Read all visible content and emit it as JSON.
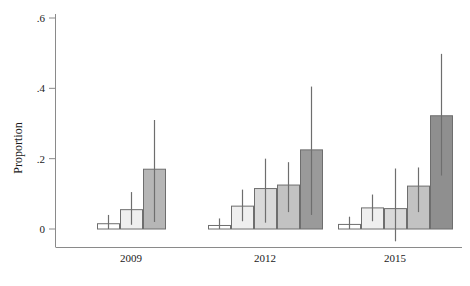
{
  "chart_data": {
    "type": "bar",
    "title": "",
    "xlabel": "",
    "ylabel": "Proportion",
    "ylim": [
      0,
      0.6
    ],
    "yticks": [
      0,
      0.2,
      0.4,
      0.6
    ],
    "ytick_labels": [
      "0",
      ".2",
      ".4",
      ".6"
    ],
    "grid": false,
    "legend": "none",
    "categories": [
      "2009",
      "2012",
      "2015"
    ],
    "groups": [
      {
        "label": "2009",
        "bars": [
          {
            "value": 0.015,
            "ci_low": 0.0,
            "ci_high": 0.04,
            "fill": "#ffffff"
          },
          {
            "value": 0.055,
            "ci_low": 0.012,
            "ci_high": 0.105,
            "fill": "#efefef"
          },
          {
            "value": 0.17,
            "ci_low": 0.02,
            "ci_high": 0.31,
            "fill": "#b6b6b6"
          }
        ]
      },
      {
        "label": "2012",
        "bars": [
          {
            "value": 0.01,
            "ci_low": 0.0,
            "ci_high": 0.03,
            "fill": "#ffffff"
          },
          {
            "value": 0.065,
            "ci_low": 0.022,
            "ci_high": 0.112,
            "fill": "#efefef"
          },
          {
            "value": 0.115,
            "ci_low": 0.018,
            "ci_high": 0.2,
            "fill": "#d9d9d9"
          },
          {
            "value": 0.125,
            "ci_low": 0.048,
            "ci_high": 0.19,
            "fill": "#c2c2c2"
          },
          {
            "value": 0.225,
            "ci_low": 0.04,
            "ci_high": 0.405,
            "fill": "#9a9a9a"
          }
        ]
      },
      {
        "label": "2015",
        "bars": [
          {
            "value": 0.013,
            "ci_low": 0.0,
            "ci_high": 0.035,
            "fill": "#ffffff"
          },
          {
            "value": 0.06,
            "ci_low": 0.022,
            "ci_high": 0.098,
            "fill": "#efefef"
          },
          {
            "value": 0.058,
            "ci_low": -0.035,
            "ci_high": 0.172,
            "fill": "#d9d9d9"
          },
          {
            "value": 0.122,
            "ci_low": 0.048,
            "ci_high": 0.175,
            "fill": "#c2c2c2"
          },
          {
            "value": 0.322,
            "ci_low": 0.152,
            "ci_high": 0.498,
            "fill": "#8f8f8f"
          }
        ]
      }
    ]
  },
  "axes": {
    "y_title": "Proportion",
    "tick_labels": [
      "0",
      ".2",
      ".4",
      ".6"
    ],
    "category_labels": [
      "2009",
      "2012",
      "2015"
    ]
  }
}
